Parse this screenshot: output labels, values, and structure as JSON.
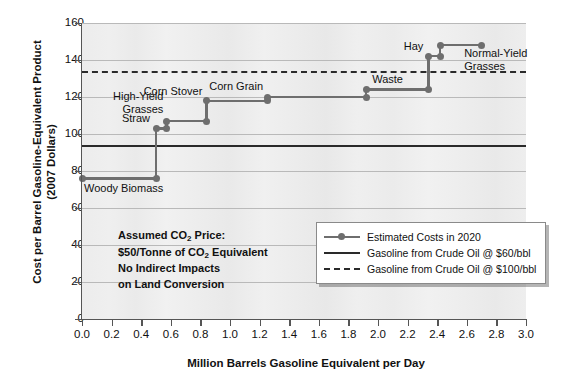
{
  "chart_data": {
    "type": "line",
    "title": "",
    "xlabel": "Million Barrels Gasoline Equivalent per Day",
    "ylabel": "Cost per Barrel Gasoline-Equivalent Product (2007 Dollars)",
    "ylabel_line1": "Cost per Barrel Gasoline-Equivalent Product",
    "ylabel_line2": "(2007 Dollars)",
    "xlim": [
      0.0,
      3.0
    ],
    "ylim": [
      0,
      160
    ],
    "grid": true,
    "legend_position": "inside-lower-right",
    "xticks": [
      "0.0",
      "0.2",
      "0.4",
      "0.6",
      "0.8",
      "1.0",
      "1.2",
      "1.4",
      "1.6",
      "1.8",
      "2.0",
      "2.2",
      "2.4",
      "2.6",
      "2.8",
      "3.0"
    ],
    "xtick_values": [
      0.0,
      0.2,
      0.4,
      0.6,
      0.8,
      1.0,
      1.2,
      1.4,
      1.6,
      1.8,
      2.0,
      2.2,
      2.4,
      2.6,
      2.8,
      3.0
    ],
    "yticks": [
      "0",
      "20",
      "40",
      "60",
      "80",
      "100",
      "120",
      "140",
      "160"
    ],
    "ytick_values": [
      0,
      20,
      40,
      60,
      80,
      100,
      120,
      140,
      160
    ],
    "series": [
      {
        "name": "Estimated Costs in 2020",
        "type": "step",
        "color": "#6e6e6e",
        "steps": [
          {
            "label": "Woody Biomass",
            "x_start": 0.0,
            "x_end": 0.5,
            "y": 76
          },
          {
            "label": "Straw",
            "x_start": 0.5,
            "x_end": 0.57,
            "y": 103
          },
          {
            "label": "High-Yield Grasses",
            "x_start": 0.57,
            "x_end": 0.84,
            "y": 107
          },
          {
            "label": "Corn Stover",
            "x_start": 0.84,
            "x_end": 1.25,
            "y": 118
          },
          {
            "label": "Corn Grain",
            "x_start": 1.25,
            "x_end": 1.92,
            "y": 120
          },
          {
            "label": "Waste",
            "x_start": 1.92,
            "x_end": 2.34,
            "y": 124
          },
          {
            "label": "Hay",
            "x_start": 2.34,
            "x_end": 2.42,
            "y": 142
          },
          {
            "label": "Normal-Yield Grasses",
            "x_start": 2.42,
            "x_end": 2.7,
            "y": 148
          }
        ]
      }
    ],
    "reference_lines": [
      {
        "name": "Gasoline from Crude Oil @ $60/bbl",
        "y": 94,
        "style": "solid",
        "color": "#2a2a2a"
      },
      {
        "name": "Gasoline from Crude Oil @ $100/bbl",
        "y": 134,
        "style": "dashed",
        "color": "#2a2a2a"
      }
    ],
    "annotations": [
      {
        "name": "assumption-note",
        "lines": [
          "Assumed CO2 Price:",
          "$50/Tonne of CO2 Equivalent",
          "No Indirect Impacts",
          "on Land Conversion"
        ]
      }
    ]
  },
  "axes": {
    "y_title_line1": "Cost per Barrel Gasoline-Equivalent Product",
    "y_title_line2": "(2007 Dollars)",
    "x_title": "Million Barrels Gasoline Equivalent per Day"
  },
  "point_labels": {
    "woody_biomass": "Woody Biomass",
    "straw": "Straw",
    "high_yield_grasses_l1": "High-Yield",
    "high_yield_grasses_l2": "Grasses",
    "corn_stover": "Corn Stover",
    "corn_grain": "Corn Grain",
    "waste": "Waste",
    "hay": "Hay",
    "normal_yield_grasses_l1": "Normal-Yield",
    "normal_yield_grasses_l2": "Grasses"
  },
  "annotation": {
    "line1_pre": "Assumed CO",
    "line1_sub": "2",
    "line1_post": " Price:",
    "line2_pre": "$50/Tonne of CO",
    "line2_sub": "2",
    "line2_post": " Equivalent",
    "line3": "No Indirect Impacts",
    "line4": "on Land Conversion"
  },
  "legend": {
    "items": [
      {
        "label": "Estimated Costs in 2020",
        "key": "line-with-marker"
      },
      {
        "label": "Gasoline from Crude Oil @ $60/bbl",
        "key": "solid-line"
      },
      {
        "label": "Gasoline from Crude Oil @ $100/bbl",
        "key": "dashed-line"
      }
    ]
  },
  "colors": {
    "series": "#6e6e6e",
    "reference": "#2a2a2a",
    "grid": "#b9b9b9",
    "plot_background": "#eeeeee",
    "page_background": "#ffffff"
  }
}
